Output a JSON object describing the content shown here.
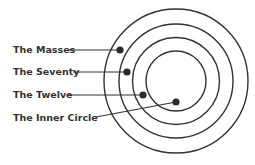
{
  "diagram": {
    "type": "concentric-circles",
    "center": {
      "x": 176,
      "y": 81
    },
    "rings": [
      {
        "name": "outer",
        "r": 72
      },
      {
        "name": "second",
        "r": 57
      },
      {
        "name": "third",
        "r": 43.5
      },
      {
        "name": "inner",
        "r": 30
      }
    ],
    "stroke_color": "#333333",
    "labels": [
      {
        "text": "The Masses",
        "label_x": 13,
        "label_y": 53,
        "line_from": [
          68,
          50
        ],
        "dot": [
          120,
          50
        ]
      },
      {
        "text": "The Seventy",
        "label_x": 13,
        "label_y": 75,
        "line_from": [
          73,
          72
        ],
        "dot": [
          127,
          72
        ]
      },
      {
        "text": "The Twelve",
        "label_x": 13,
        "label_y": 98,
        "line_from": [
          68,
          95
        ],
        "dot": [
          143,
          95
        ]
      },
      {
        "text": "The Inner Circle",
        "label_x": 13,
        "label_y": 121,
        "line_from": [
          96,
          117
        ],
        "dot": [
          176,
          102
        ]
      }
    ]
  }
}
